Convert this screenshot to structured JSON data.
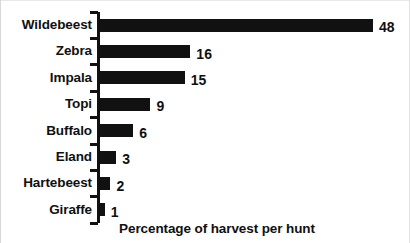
{
  "chart_data": {
    "type": "bar",
    "orientation": "horizontal",
    "title": "",
    "xlabel": "Percentage of harvest per hunt",
    "ylabel": "",
    "categories": [
      "Wildebeest",
      "Zebra",
      "Impala",
      "Topi",
      "Buffalo",
      "Eland",
      "Hartebeest",
      "Giraffe"
    ],
    "values": [
      48,
      16,
      15,
      9,
      6,
      3,
      2,
      1
    ],
    "value_labels": [
      "48",
      "16",
      "15",
      "9",
      "6",
      "3",
      "2",
      "1"
    ],
    "xlim": [
      0,
      48
    ],
    "grid": false,
    "legend": false,
    "bar_color": "#111111",
    "background_color": "#ffffff",
    "axis_color": "#111111"
  },
  "figure": {
    "axis_title": "Percentage of harvest per hunt"
  }
}
